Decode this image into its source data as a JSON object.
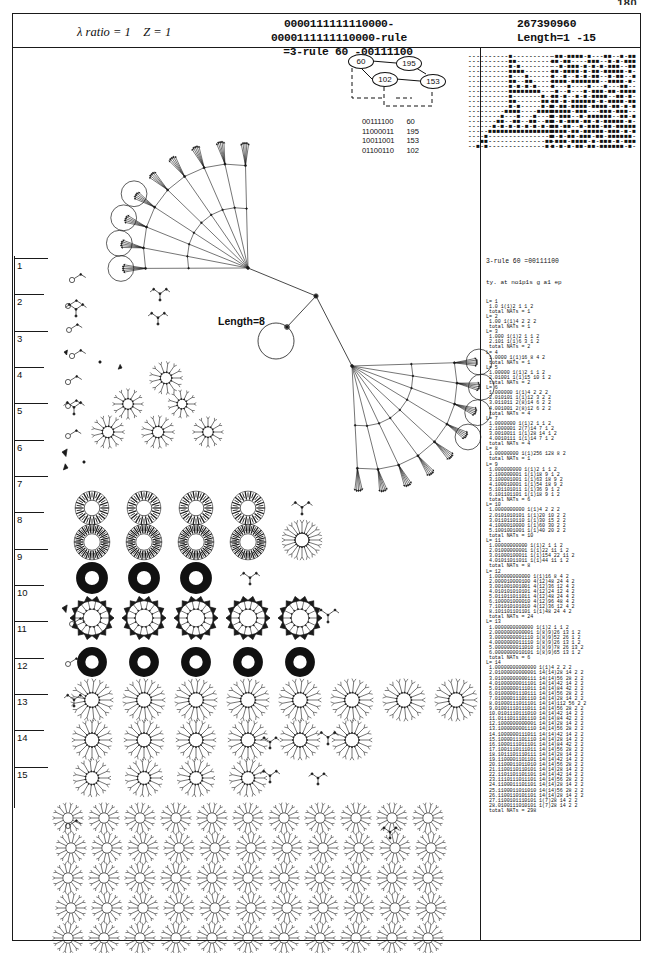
{
  "page": {
    "number": "180"
  },
  "header": {
    "lambda_label": "λ ratio = 1",
    "z_label": "Z = 1",
    "code_line1": "0000111111110000-0000111111110000-rule",
    "code_line2": "=3-rule 60 -00111100",
    "rule_number": "267390960",
    "length_label": "Length=1 -15"
  },
  "inset_graph": {
    "nodes": [
      {
        "id": "60",
        "x": 4,
        "y": 0
      },
      {
        "id": "195",
        "x": 52,
        "y": 2
      },
      {
        "id": "102",
        "x": 28,
        "y": 18
      },
      {
        "id": "153",
        "x": 76,
        "y": 20
      }
    ],
    "lookup_table": [
      {
        "bits": "00111100",
        "value": "60"
      },
      {
        "bits": "11000011",
        "value": "195"
      },
      {
        "bits": "10011001",
        "value": "153"
      },
      {
        "bits": "01100110",
        "value": "102"
      }
    ]
  },
  "ca_left": {
    "caption": "rule-60 spacetime from single seed",
    "rows": [
      "----------■----------",
      "----------■■---------",
      "----------■-■--------",
      "----------■■■■-------",
      "----------■---■------",
      "----------■■--■■-----",
      "----------■-■-■-■----",
      "----------■■■■■■■■---",
      "----------■-------■--",
      "----------■■------■■-",
      "----------■-■-----■-■",
      "---------■■■■----■■■■",
      "--------■---■---■---■",
      "-------■■--■■--■■--■■",
      "------■-■-■-■-■-■-■-■",
      "-----■■■■■■■■■■■■■■■■",
      "----■---------------■",
      "---■■--------------■■",
      "--■-■--------------■-"
    ]
  },
  "ca_right": {
    "caption": "rule-60 spacetime from random seed",
    "rows": [
      "-■■-■■■■-■---■■--■-■■",
      "■■-■■----■■■--■-■-■■■",
      "--■-■■■-■-■-■-■■■--■■",
      "■■-■■■■-■-■■-■■■■■-■-",
      "■--■--■-■-■■--■-■■--■",
      "■■■■-■■■■■■■--■■■■-■-",
      "■---■----■---■---■■--",
      "-■--■---■-■■■-■■-■■■■",
      "■■-■--■-■-■■■■--■■-■-",
      "■■-■-■■■■■■-■-■■■■-■■",
      "■-■■-■■■■-■■■■-■■-■-■",
      "■■■■■-■■■---■■■-■■■--",
      "■-■■■--■-■■■■■■--■■-■",
      "■-■-■■■-■■-■-■■■■■-■-",
      "■■-■■--■-■■■-■■-■■■■■",
      "■■■■-■■-■■■■■-■■■-■-■",
      "■-■-■■-■■■-■■-■■■■■■-",
      "-■■■-■■■■-■-■■■-■-■■■",
      "■-■-■-■■-■■-■■■■■■-■-"
    ]
  },
  "center_graph": {
    "length_label": "Length=8"
  },
  "ladder": {
    "labels": [
      "1",
      "2",
      "3",
      "4",
      "5",
      "6",
      "7",
      "8",
      "9",
      "10",
      "11",
      "12",
      "13",
      "14",
      "15"
    ]
  },
  "right_column": {
    "title": "3-rule 60 =00111100",
    "subtitle": "ty. at no1p1s g a1 ep",
    "footer": "total NATs = 298",
    "sections": [
      {
        "header": "L= 1",
        "lines": [
          "1.0 1(1)2 1 1 2"
        ],
        "total": "total NATs = 1"
      },
      {
        "header": "L= 2",
        "lines": [
          "1.00 1(1)4 2 2 2"
        ],
        "total": "total NATs = 1"
      },
      {
        "header": "L= 3",
        "lines": [
          "1.000 1(1)2 1 1 2",
          "2.101 1(1)6 3 1 2"
        ],
        "total": "total NATs = 2"
      },
      {
        "header": "L= 4",
        "lines": [
          "1.0000 1(1)16 8 4 2"
        ],
        "total": "total NATs = 1"
      },
      {
        "header": "L= 5",
        "lines": [
          "1.00000 1(1)2 1 1 2",
          "2.01001 1(1)15 10 1 2"
        ],
        "total": "total NATs = 2"
      },
      {
        "header": "L= 6",
        "lines": [
          "1.000000 1(1)4 2 2 2",
          "2.010101 1(1)12 3 2 2",
          "3.011011 2(8)14 6 2 2",
          "4.001001 2(8)12 6 2 2"
        ],
        "total": "total NATs = 4"
      },
      {
        "header": "L= 7",
        "lines": [
          "1.0000000 1(1)2 1 1 2",
          "2.1000001 2(7)14 7 1 2",
          "3.0010011 1(1)28 14 1 2",
          "4.0010111 1(1)14 7 1 2"
        ],
        "total": "total NATs = 4"
      },
      {
        "header": "L= 8",
        "lines": [
          "1.00000000 1(1)256 128 8 2"
        ],
        "total": "total NATs = 1"
      },
      {
        "header": "L= 9",
        "lines": [
          "1.000000000 1(1)2 1 1 2",
          "2.100000001 1(1)18 9 1 2",
          "3.100001001 1(1)63 18 9 2",
          "4.100010001 1(1)54 18 9 2",
          "5.101101011 1(1)36 9 1 2",
          "6.101101101 1(1)18 9 1 2"
        ],
        "total": "total NATs = 6"
      },
      {
        "header": "L= 10",
        "lines": [
          "1.0000000000 1(1)4 2 2 2",
          "2.0101010101 1(1)20 10 2 2",
          "3.0110110110 1(1)30 15 2 2",
          "4.1000010000 1(1)60 30 2 2",
          "5.1001001001 1(1)40 20 2 2"
        ],
        "total": "total NATs = 10"
      },
      {
        "header": "L= 11",
        "lines": [
          "1.00000000000 1(1)2 1 1 2",
          "2.01000000001 1(1)22 11 1 2",
          "3.01000100011 1(1)154 22 11 2",
          "4.01011011011 1(1)44 11 1 2"
        ],
        "total": "total NATs = 8"
      },
      {
        "header": "L= 12",
        "lines": [
          "1.000000000000 1(1)16 8 4 2",
          "2.000010000100 4(12)48 24 4 2",
          "3.001001001001 4(12)36 12 4 2",
          "4.010101010101 4(12)24 12 4 2",
          "5.011011011011 4(12)48 24 4 2",
          "6.100001000010 4(12)96 48 4 2",
          "7.101010101010 4(12)36 12 4 2",
          "8.101101101101 1(1)48 24 4 2"
        ],
        "total": "total NATs = 24"
      },
      {
        "header": "L= 13",
        "lines": [
          "1.0000000000000 1(1)2 1 1 2",
          "2.0000000000001 1(8)9)26 13 1 2",
          "3.0000000001110 1(8)9)52 26 1 2",
          "4.0000000011110 1(8)9)26 13 1 2",
          "5.0000000011010 1(8)9)78 26 13 2",
          "6.0000000010101 1(8)9)65 13 1 2"
        ],
        "total": "total NATs = 6"
      },
      {
        "header": "L= 14",
        "lines": [
          "1.00000000000000 1(1)4 2 2 2",
          "2.01000000000001 14(14)28 14 2 2",
          "3.01000000000111 14(14)56 28 2 2",
          "4.01000000011101 14(14)42 14 2 2",
          "5.01000000111011 14(14)84 42 2 2",
          "6.01000001110111 14(14)56 28 2 2",
          "7.01000011101110 14(14)28 14 2 2",
          "8.01000111011101 14(14)112 56 2 2",
          "9.01001110111011 14(14)56 28 2 2",
          "10.0101110111010 14(14)42 14 2 2",
          "11.0111011101110 14(14)84 42 2 2",
          "12.1000000000001 14(14)28 14 2 2",
          "13.1000000001110 14(14)56 28 2 2",
          "14.1000000111011 14(14)42 14 2 2",
          "15.1000011101110 14(14)28 14 2 2",
          "16.1000111011101 14(14)84 42 2 2",
          "17.1001110111011 14(14)56 28 2 2",
          "18.1011101110111 14(14)28 14 2 2",
          "19.1100001101101 14(14)42 14 2 2",
          "20.1100011011010 14(14)56 28 2 2",
          "21.1100110110101 14(14)28 14 2 2",
          "22.1101101101101 14(14)42 14 2 2",
          "23.1110111011101 14(14)56 28 2 2",
          "24.1100011101101 14(14)28 14 2 2",
          "25.1100011011010 14(14)56 28 2 2",
          "26.1100110101101 14(14)28 14 2 2",
          "27.1100101110101 1(7)28 14 2 2",
          "28.0100111010101 1(7)28 14 2 2"
        ],
        "total": "total NATs = 298"
      }
    ]
  }
}
